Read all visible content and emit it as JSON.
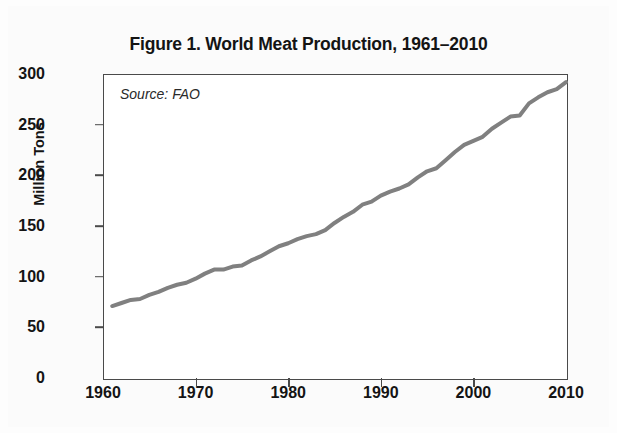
{
  "figure": {
    "title": "Figure 1. World Meat Production, 1961–2010",
    "source_note": "Source: FAO",
    "background_color": "#fbfbfb",
    "frame_color": "#4a4a4a"
  },
  "axes": {
    "y_title": "Million Tons",
    "y_ticks": [
      "0",
      "50",
      "100",
      "150",
      "200",
      "250",
      "300"
    ],
    "x_ticks": [
      "1960",
      "1970",
      "1980",
      "1990",
      "2000",
      "2010"
    ]
  },
  "chart_data": {
    "type": "line",
    "title": "Figure 1. World Meat Production, 1961–2010",
    "subtitle": "",
    "xlabel": "",
    "ylabel": "Million Tons",
    "annotations": [
      "Source: FAO"
    ],
    "grid": false,
    "legend": false,
    "legend_position": "none",
    "line_color": "#808080",
    "line_width": 4,
    "xlim": [
      1960,
      2010
    ],
    "ylim": [
      0,
      300
    ],
    "x_tick_values": [
      1960,
      1970,
      1980,
      1990,
      2000,
      2010
    ],
    "y_tick_values": [
      0,
      50,
      100,
      150,
      200,
      250,
      300
    ],
    "units": "million tons",
    "x": [
      1961,
      1962,
      1963,
      1964,
      1965,
      1966,
      1967,
      1968,
      1969,
      1970,
      1971,
      1972,
      1973,
      1974,
      1975,
      1976,
      1977,
      1978,
      1979,
      1980,
      1981,
      1982,
      1983,
      1984,
      1985,
      1986,
      1987,
      1988,
      1989,
      1990,
      1991,
      1992,
      1993,
      1994,
      1995,
      1996,
      1997,
      1998,
      1999,
      2000,
      2001,
      2002,
      2003,
      2004,
      2005,
      2006,
      2007,
      2008,
      2009,
      2010
    ],
    "series": [
      {
        "name": "World meat production",
        "values": [
          71,
          74,
          77,
          78,
          82,
          85,
          89,
          92,
          94,
          98,
          103,
          107,
          107,
          110,
          111,
          116,
          120,
          125,
          130,
          133,
          137,
          140,
          142,
          146,
          153,
          159,
          164,
          171,
          174,
          180,
          184,
          187,
          191,
          198,
          204,
          207,
          215,
          223,
          230,
          234,
          238,
          246,
          252,
          258,
          259,
          271,
          277,
          282,
          285,
          292
        ]
      }
    ],
    "first_point": {
      "x": 1961,
      "y": 71
    },
    "last_point": {
      "x": 2010,
      "y": 292
    }
  }
}
